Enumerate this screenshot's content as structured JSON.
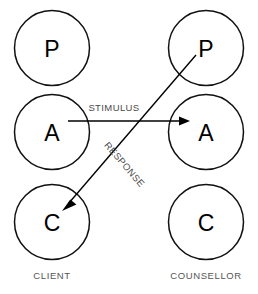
{
  "diagram": {
    "colors": {
      "background": "#ffffff",
      "circle_stroke": "#111111",
      "circle_fill": "#ffffff",
      "letter": "#000000",
      "arrow": "#000000",
      "arrow_label": "#4a4a4a",
      "column_label": "#555555"
    },
    "columns": [
      {
        "key": "client",
        "label": "CLIENT",
        "label_x": 52,
        "label_y": 276,
        "center_x": 52,
        "states": [
          {
            "key": "client-parent",
            "letter": "P",
            "cx": 52,
            "cy": 48,
            "r": 37.5
          },
          {
            "key": "client-adult",
            "letter": "A",
            "cx": 52,
            "cy": 132,
            "r": 37.5
          },
          {
            "key": "client-child",
            "letter": "C",
            "cx": 52,
            "cy": 222,
            "r": 37.5
          }
        ]
      },
      {
        "key": "counsellor",
        "label": "COUNSELLOR",
        "label_x": 206,
        "label_y": 276,
        "center_x": 206,
        "states": [
          {
            "key": "counsellor-parent",
            "letter": "P",
            "cx": 206,
            "cy": 48,
            "r": 37.5
          },
          {
            "key": "counsellor-adult",
            "letter": "A",
            "cx": 206,
            "cy": 132,
            "r": 37.5
          },
          {
            "key": "counsellor-child",
            "letter": "C",
            "cx": 206,
            "cy": 222,
            "r": 37.5
          }
        ]
      }
    ],
    "transactions": [
      {
        "key": "stimulus",
        "label": "STIMULUS",
        "from": "client-adult",
        "to": "counsellor-adult",
        "x1": 68,
        "y1": 121,
        "x2": 190,
        "y2": 121,
        "label_x": 114,
        "label_y": 108,
        "label_rotation": 0
      },
      {
        "key": "response",
        "label": "RESPONSE",
        "from": "counsellor-parent",
        "to": "client-child",
        "x1": 196,
        "y1": 55,
        "x2": 62,
        "y2": 211,
        "label_x": 124,
        "label_y": 165,
        "label_rotation": 49.4
      }
    ]
  }
}
